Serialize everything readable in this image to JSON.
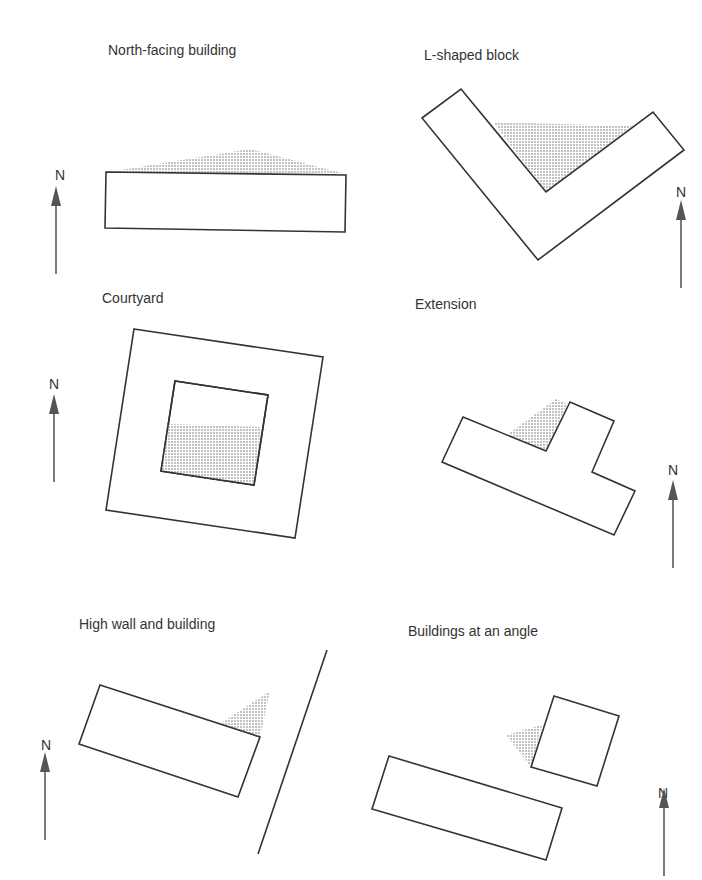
{
  "panels": [
    {
      "id": "north-facing",
      "title": "North-facing building",
      "north": "N"
    },
    {
      "id": "l-shaped",
      "title": "L-shaped block",
      "north": "N"
    },
    {
      "id": "courtyard",
      "title": "Courtyard",
      "north": "N"
    },
    {
      "id": "extension",
      "title": "Extension",
      "north": "N"
    },
    {
      "id": "high-wall",
      "title": "High wall and building",
      "north": "N"
    },
    {
      "id": "angle",
      "title": "Buildings at an angle",
      "north": "N"
    }
  ],
  "colors": {
    "outline": "#333333",
    "shadow_dot": "#555555",
    "background": "#ffffff"
  }
}
